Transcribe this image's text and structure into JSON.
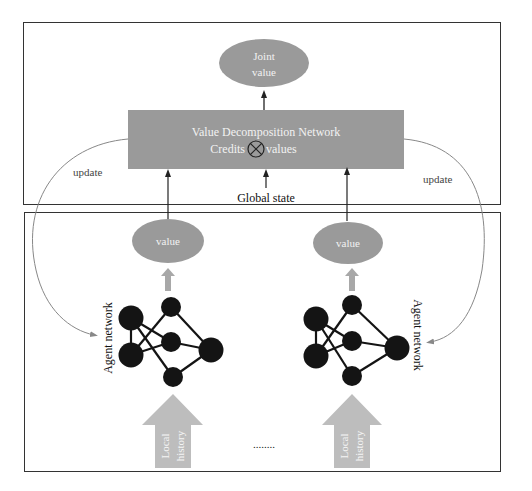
{
  "diagram": {
    "top_panel": {
      "joint_value": {
        "line1": "Joint",
        "line2": "value"
      },
      "vdn_box": {
        "title": "Value Decomposition Network",
        "credits": "Credits",
        "values": "values",
        "operator": "otimes"
      },
      "global_state": "Global state"
    },
    "update_labels": {
      "left": "update",
      "right": "update"
    },
    "agents": [
      {
        "value_label": "value",
        "network_label": "Agent network",
        "input_label": {
          "line1": "Local",
          "line2": "history"
        }
      },
      {
        "value_label": "value",
        "network_label": "Agent network",
        "input_label": {
          "line1": "Local",
          "line2": "history"
        }
      }
    ],
    "ellipsis": "........",
    "colors": {
      "box_fill": "#9a9a9a",
      "ellipse_fill": "#9a9a9a",
      "node_fill": "#141414",
      "input_arrow_fill": "#bdbdbd",
      "small_arrow_fill": "#a8a8a8",
      "text_on_gray": "#f2f2f2",
      "border": "#333333"
    }
  }
}
